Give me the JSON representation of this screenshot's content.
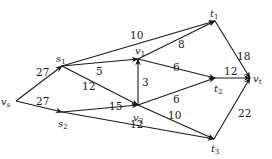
{
  "diagram": {
    "type": "flow-network",
    "nodes": [
      {
        "id": "vs",
        "base": "v",
        "sub": "s",
        "x": 16,
        "y": 101,
        "lx": 1,
        "ly": 105
      },
      {
        "id": "s1",
        "base": "s",
        "sub": "1",
        "x": 62,
        "y": 66,
        "lx": 56,
        "ly": 62
      },
      {
        "id": "s2",
        "base": "s",
        "sub": "2",
        "x": 62,
        "y": 112,
        "lx": 58,
        "ly": 127
      },
      {
        "id": "v1",
        "base": "v",
        "sub": "1",
        "x": 138,
        "y": 59,
        "lx": 135,
        "ly": 54
      },
      {
        "id": "v2",
        "base": "v",
        "sub": "2",
        "x": 138,
        "y": 105,
        "lx": 133,
        "ly": 121
      },
      {
        "id": "t1",
        "base": "t",
        "sub": "1",
        "x": 215,
        "y": 21,
        "lx": 210,
        "ly": 17
      },
      {
        "id": "t2",
        "base": "t",
        "sub": "2",
        "x": 215,
        "y": 78,
        "lx": 214,
        "ly": 92
      },
      {
        "id": "t3",
        "base": "t",
        "sub": "3",
        "x": 214,
        "y": 139,
        "lx": 211,
        "ly": 152
      },
      {
        "id": "vt",
        "base": "v",
        "sub": "t",
        "x": 250,
        "y": 78,
        "lx": 253,
        "ly": 82
      }
    ],
    "edges": [
      {
        "from": "vs",
        "to": "s1",
        "capacity": "27",
        "lx": 36,
        "ly": 76
      },
      {
        "from": "vs",
        "to": "s2",
        "capacity": "27",
        "lx": 36,
        "ly": 105
      },
      {
        "from": "s1",
        "to": "t1",
        "capacity": "10",
        "lx": 130,
        "ly": 39
      },
      {
        "from": "s1",
        "to": "v1",
        "capacity": "5",
        "lx": 96,
        "ly": 75
      },
      {
        "from": "s1",
        "to": "v2",
        "capacity": "12",
        "lx": 82,
        "ly": 90
      },
      {
        "from": "s2",
        "to": "v2",
        "capacity": "15",
        "lx": 109,
        "ly": 110
      },
      {
        "from": "s2",
        "to": "t3",
        "capacity": "12",
        "lx": 130,
        "ly": 128
      },
      {
        "from": "v2",
        "to": "v1",
        "capacity": "3",
        "lx": 142,
        "ly": 86
      },
      {
        "from": "v1",
        "to": "t1",
        "capacity": "8",
        "lx": 178,
        "ly": 48
      },
      {
        "from": "v1",
        "to": "t2",
        "capacity": "6",
        "lx": 173,
        "ly": 71
      },
      {
        "from": "v2",
        "to": "t2",
        "capacity": "6",
        "lx": 173,
        "ly": 103
      },
      {
        "from": "v2",
        "to": "t3",
        "capacity": "10",
        "lx": 168,
        "ly": 119
      },
      {
        "from": "t1",
        "to": "vt",
        "capacity": "18",
        "lx": 237,
        "ly": 60
      },
      {
        "from": "t2",
        "to": "vt",
        "capacity": "12",
        "lx": 224,
        "ly": 75
      },
      {
        "from": "t3",
        "to": "vt",
        "capacity": "22",
        "lx": 238,
        "ly": 117
      }
    ]
  }
}
